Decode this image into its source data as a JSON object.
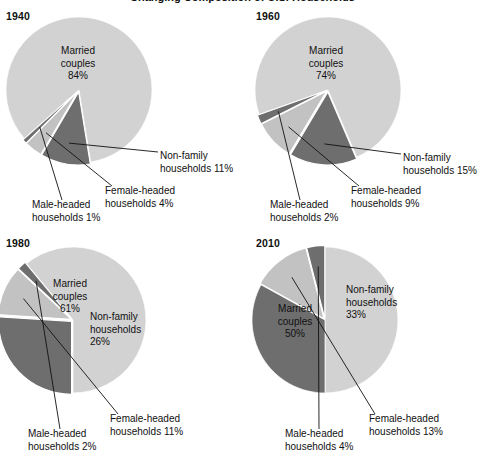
{
  "figure": {
    "title": "Changing Composition of U.S. Households",
    "title_clipped": true,
    "background": "#ffffff"
  },
  "colors": {
    "married": "#d2d2d2",
    "nonfamily": "#6e6e6e",
    "female": "#c2c2c2",
    "male": "#6e6e6e",
    "text": "#111111",
    "leader": "#111111"
  },
  "chart_data": {
    "type": "pie",
    "title": "Changing Composition of U.S. Households",
    "unit": "percent",
    "categories": [
      "Married couples",
      "Non-family households",
      "Female-headed households",
      "Male-headed households"
    ],
    "panels": [
      {
        "year": "1940",
        "values": [
          84,
          11,
          4,
          1
        ],
        "labels": [
          "Married couples 84%",
          "Non-family households 11%",
          "Female-headed households 4%",
          "Male-headed households 1%"
        ]
      },
      {
        "year": "1960",
        "values": [
          74,
          15,
          9,
          2
        ],
        "labels": [
          "Married couples 74%",
          "Non-family households 15%",
          "Female-headed households 9%",
          "Male-headed households 2%"
        ]
      },
      {
        "year": "1980",
        "values": [
          61,
          26,
          11,
          2
        ],
        "labels": [
          "Married couples 61%",
          "Non-family households 26%",
          "Female-headed households 11%",
          "Male-headed households 2%"
        ]
      },
      {
        "year": "2010",
        "values": [
          50,
          33,
          13,
          4
        ],
        "labels": [
          "Married couples 50%",
          "Non-family households 33%",
          "Female-headed households 13%",
          "Male-headed households 4%"
        ]
      }
    ]
  },
  "panels": {
    "p1940": {
      "year": "1940",
      "married_l1": "Married",
      "married_l2": "couples",
      "married_l3": "84%",
      "nonfamily_l1": "Non-family",
      "nonfamily_l2": "households 11%",
      "female_l1": "Female-headed",
      "female_l2": "households 4%",
      "male_l1": "Male-headed",
      "male_l2": "households 1%"
    },
    "p1960": {
      "year": "1960",
      "married_l1": "Married",
      "married_l2": "couples",
      "married_l3": "74%",
      "nonfamily_l1": "Non-family",
      "nonfamily_l2": "households 15%",
      "female_l1": "Female-headed",
      "female_l2": "households 9%",
      "male_l1": "Male-headed",
      "male_l2": "households 2%"
    },
    "p1980": {
      "year": "1980",
      "married_l1": "Married",
      "married_l2": "couples",
      "married_l3": "61%",
      "nonfamily_l1": "Non-family",
      "nonfamily_l2": "households",
      "nonfamily_l3": "26%",
      "female_l1": "Female-headed",
      "female_l2": "households 11%",
      "male_l1": "Male-headed",
      "male_l2": "households 2%"
    },
    "p2010": {
      "year": "2010",
      "married_l1": "Married",
      "married_l2": "couples",
      "married_l3": "50%",
      "nonfamily_l1": "Non-family",
      "nonfamily_l2": "households",
      "nonfamily_l3": "33%",
      "female_l1": "Female-headed",
      "female_l2": "households 13%",
      "male_l1": "Male-headed",
      "male_l2": "households 4%"
    }
  }
}
